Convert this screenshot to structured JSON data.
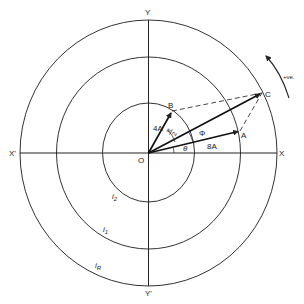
{
  "diagram": {
    "axes": {
      "x_pos": "X",
      "x_neg": "X'",
      "y_pos": "Y",
      "y_neg": "Y'"
    },
    "origin_label": "O",
    "circles": [
      {
        "label": "i2",
        "base": "i",
        "sub": "2",
        "rx": 49,
        "ry": 50
      },
      {
        "label": "i1",
        "base": "i",
        "sub": "1",
        "rx": 93,
        "ry": 96
      },
      {
        "label": "iR",
        "base": "i",
        "sub": "R",
        "rx": 129,
        "ry": 133
      }
    ],
    "points": {
      "A": "A",
      "B": "B",
      "C": "C"
    },
    "vectors": [
      {
        "name": "OA",
        "magnitude_label": "8A"
      },
      {
        "name": "OB",
        "magnitude_label": "4A"
      },
      {
        "name": "OC",
        "magnitude_label": ""
      }
    ],
    "angles": {
      "theta": "θ",
      "phi": "Φ",
      "pi_over_2_num": "π",
      "pi_over_2_den": "2"
    },
    "rotation": {
      "label": "+ve.",
      "direction": "counter-clockwise"
    },
    "colors": {
      "line": "#222222",
      "background": "#ffffff"
    }
  }
}
